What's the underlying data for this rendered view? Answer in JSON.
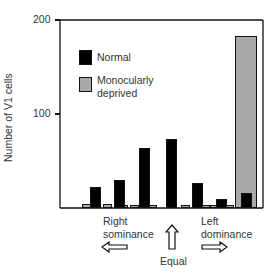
{
  "chart_data": {
    "type": "bar",
    "title": "",
    "xlabel": "",
    "ylabel": "Number of V1 cells",
    "ylim": [
      0,
      200
    ],
    "yticks": [
      100,
      200
    ],
    "categories": [
      "1",
      "2",
      "3",
      "4",
      "5",
      "6",
      "7"
    ],
    "series": [
      {
        "name": "Normal",
        "color": "#000000",
        "values": [
          22,
          30,
          64,
          73,
          27,
          10,
          16
        ]
      },
      {
        "name": "Monocularly deprived",
        "color": "#a8a8a8",
        "values": [
          4,
          4,
          3,
          0,
          3,
          3,
          183
        ]
      }
    ],
    "legend": {
      "position": "upper-left",
      "entries": [
        "Normal",
        "Monocularly deprived"
      ]
    },
    "grid": false,
    "annotations": [
      "Right sominance",
      "Equal",
      "Left dominance"
    ]
  },
  "axis": {
    "y_top": "200",
    "y_mid": "100",
    "ylabel": "Number of V1 cells"
  },
  "legend": {
    "normal": "Normal",
    "md_line1": "Monocularly",
    "md_line2": "deprived"
  },
  "annotations": {
    "right_line1": "Right",
    "right_line2": "sominance",
    "equal": "Equal",
    "left_line1": "Left",
    "left_line2": "dominance"
  }
}
